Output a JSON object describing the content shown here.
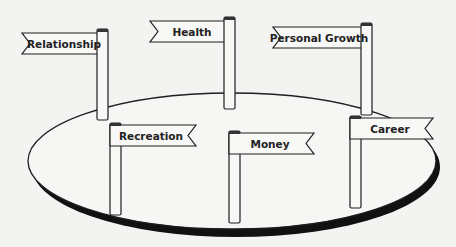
{
  "diagram": {
    "type": "life-areas-island",
    "colors": {
      "background": "#f3f3f1",
      "stroke": "#1e1e1e",
      "fill": "#f6f6f4",
      "shadow": "#111111"
    },
    "platform": {
      "cx": 232,
      "cy": 161,
      "rx": 204,
      "ry": 68
    },
    "signposts": [
      {
        "label": "Relationship",
        "pole_x": 97,
        "pole_top": 29,
        "pole_bottom": 120,
        "flag_left": 22,
        "flag_top": 33,
        "direction": "left"
      },
      {
        "label": "Health",
        "pole_x": 224,
        "pole_top": 17,
        "pole_bottom": 109,
        "flag_left": 150,
        "flag_top": 21,
        "direction": "left"
      },
      {
        "label": "Personal Growth",
        "pole_x": 361,
        "pole_top": 23,
        "pole_bottom": 115,
        "flag_left": 273,
        "flag_top": 27,
        "direction": "left"
      },
      {
        "label": "Recreation",
        "pole_x": 110,
        "pole_top": 123,
        "pole_bottom": 215,
        "flag_right": 196,
        "flag_top": 125,
        "direction": "right"
      },
      {
        "label": "Money",
        "pole_x": 229,
        "pole_top": 131,
        "pole_bottom": 223,
        "flag_right": 314,
        "flag_top": 133,
        "direction": "right"
      },
      {
        "label": "Career",
        "pole_x": 350,
        "pole_top": 116,
        "pole_bottom": 208,
        "flag_right": 433,
        "flag_top": 118,
        "direction": "right"
      }
    ]
  }
}
